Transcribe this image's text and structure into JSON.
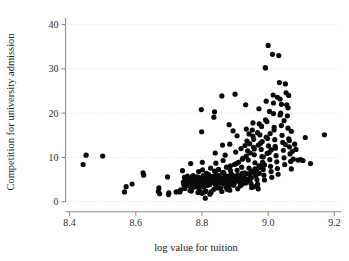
{
  "chart_data": {
    "type": "scatter",
    "title": "",
    "xlabel": "log value for tuition",
    "ylabel": "Competition for university admission",
    "xlim": [
      8.35,
      9.22
    ],
    "ylim": [
      -1.2,
      41.5
    ],
    "xticks": [
      8.4,
      8.6,
      8.8,
      9.0,
      9.2
    ],
    "xtick_labels": [
      "8.4",
      "8.6",
      "8.8",
      "9.0",
      "9.2"
    ],
    "yticks": [
      0,
      10,
      20,
      30,
      40
    ],
    "ytick_labels": [
      "0",
      "10",
      "20",
      "30",
      "40"
    ],
    "grid": "horizontal-dotted",
    "legend": "none",
    "marker": {
      "shape": "circle",
      "color": "#0a0a0a",
      "size_px": 2.6
    },
    "n_points": 312,
    "points": [
      [
        8.441,
        8.4
      ],
      [
        8.45,
        10.5
      ],
      [
        8.5,
        10.3
      ],
      [
        8.566,
        2.2
      ],
      [
        8.571,
        3.4
      ],
      [
        8.589,
        4.0
      ],
      [
        8.622,
        6.5
      ],
      [
        8.624,
        6.0
      ],
      [
        8.668,
        2.3
      ],
      [
        8.67,
        3.1
      ],
      [
        8.672,
        1.8
      ],
      [
        8.696,
        5.6
      ],
      [
        8.699,
        1.6
      ],
      [
        8.7,
        2.0
      ],
      [
        8.722,
        2.2
      ],
      [
        8.729,
        2.3
      ],
      [
        8.733,
        2.2
      ],
      [
        8.741,
        7.0
      ],
      [
        8.744,
        4.4
      ],
      [
        8.747,
        5.5
      ],
      [
        8.749,
        5.0
      ],
      [
        8.752,
        5.4
      ],
      [
        8.755,
        3.6
      ],
      [
        8.758,
        5.3
      ],
      [
        8.76,
        5.1
      ],
      [
        8.763,
        4.9
      ],
      [
        8.766,
        8.6
      ],
      [
        8.768,
        2.4
      ],
      [
        8.77,
        5.6
      ],
      [
        8.772,
        4.7
      ],
      [
        8.775,
        5.2
      ],
      [
        8.777,
        5.5
      ],
      [
        8.779,
        4.3
      ],
      [
        8.781,
        3.4
      ],
      [
        8.784,
        5.6
      ],
      [
        8.786,
        5.1
      ],
      [
        8.788,
        4.6
      ],
      [
        8.79,
        5.5
      ],
      [
        8.792,
        2.6
      ],
      [
        8.794,
        4.1
      ],
      [
        8.796,
        5.3
      ],
      [
        8.798,
        20.8
      ],
      [
        8.799,
        15.8
      ],
      [
        8.801,
        8.9
      ],
      [
        8.803,
        5.4
      ],
      [
        8.805,
        4.4
      ],
      [
        8.806,
        3.3
      ],
      [
        8.808,
        2.2
      ],
      [
        8.81,
        0.8
      ],
      [
        8.812,
        5.8
      ],
      [
        8.814,
        4.0
      ],
      [
        8.816,
        5.2
      ],
      [
        8.818,
        4.7
      ],
      [
        8.82,
        6.1
      ],
      [
        8.822,
        5.0
      ],
      [
        8.824,
        3.9
      ],
      [
        8.826,
        5.5
      ],
      [
        8.828,
        2.2
      ],
      [
        8.83,
        4.5
      ],
      [
        8.832,
        5.7
      ],
      [
        8.834,
        5.0
      ],
      [
        8.836,
        19.1
      ],
      [
        8.838,
        20.3
      ],
      [
        8.84,
        11.0
      ],
      [
        8.842,
        8.7
      ],
      [
        8.844,
        6.1
      ],
      [
        8.846,
        5.3
      ],
      [
        8.848,
        4.8
      ],
      [
        8.85,
        5.9
      ],
      [
        8.852,
        4.2
      ],
      [
        8.854,
        5.5
      ],
      [
        8.856,
        3.1
      ],
      [
        8.858,
        5.1
      ],
      [
        8.86,
        23.9
      ],
      [
        8.862,
        12.8
      ],
      [
        8.864,
        9.3
      ],
      [
        8.866,
        6.6
      ],
      [
        8.868,
        5.4
      ],
      [
        8.87,
        4.9
      ],
      [
        8.872,
        5.8
      ],
      [
        8.874,
        5.3
      ],
      [
        8.876,
        2.8
      ],
      [
        8.878,
        4.4
      ],
      [
        8.88,
        5.6
      ],
      [
        8.882,
        3.5
      ],
      [
        8.884,
        13.0
      ],
      [
        8.886,
        8.1
      ],
      [
        8.888,
        6.3
      ],
      [
        8.89,
        5.2
      ],
      [
        8.892,
        4.6
      ],
      [
        8.894,
        5.9
      ],
      [
        8.896,
        5.1
      ],
      [
        8.898,
        4.2
      ],
      [
        8.9,
        24.3
      ],
      [
        8.902,
        11.2
      ],
      [
        8.904,
        8.6
      ],
      [
        8.906,
        7.1
      ],
      [
        8.908,
        6.0
      ],
      [
        8.91,
        5.4
      ],
      [
        8.912,
        4.8
      ],
      [
        8.914,
        5.6
      ],
      [
        8.916,
        3.6
      ],
      [
        8.918,
        5.0
      ],
      [
        8.92,
        7.8
      ],
      [
        8.922,
        6.4
      ],
      [
        8.924,
        9.8
      ],
      [
        8.926,
        5.7
      ],
      [
        8.928,
        4.5
      ],
      [
        8.93,
        5.2
      ],
      [
        8.932,
        21.9
      ],
      [
        8.934,
        16.4
      ],
      [
        8.936,
        13.7
      ],
      [
        8.938,
        11.5
      ],
      [
        8.94,
        9.4
      ],
      [
        8.942,
        7.6
      ],
      [
        8.944,
        6.2
      ],
      [
        8.946,
        5.3
      ],
      [
        8.948,
        4.1
      ],
      [
        8.95,
        3.2
      ],
      [
        8.952,
        16.2
      ],
      [
        8.954,
        14.8
      ],
      [
        8.956,
        12.3
      ],
      [
        8.958,
        10.6
      ],
      [
        8.96,
        8.8
      ],
      [
        8.962,
        7.2
      ],
      [
        8.964,
        6.1
      ],
      [
        8.966,
        5.0
      ],
      [
        8.968,
        3.8
      ],
      [
        8.97,
        2.9
      ],
      [
        8.972,
        21.0
      ],
      [
        8.973,
        17.6
      ],
      [
        8.975,
        15.1
      ],
      [
        8.977,
        13.2
      ],
      [
        8.979,
        11.8
      ],
      [
        8.981,
        10.2
      ],
      [
        8.983,
        8.9
      ],
      [
        8.985,
        7.3
      ],
      [
        8.987,
        6.0
      ],
      [
        8.989,
        4.9
      ],
      [
        8.991,
        30.3
      ],
      [
        8.992,
        30.2
      ],
      [
        8.994,
        22.7
      ],
      [
        8.996,
        18.1
      ],
      [
        8.998,
        14.3
      ],
      [
        9.0,
        35.3
      ],
      [
        9.001,
        12.6
      ],
      [
        9.003,
        11.1
      ],
      [
        9.005,
        9.5
      ],
      [
        9.007,
        8.0
      ],
      [
        9.009,
        6.8
      ],
      [
        9.011,
        5.5
      ],
      [
        9.013,
        33.3
      ],
      [
        9.015,
        24.1
      ],
      [
        9.016,
        19.9
      ],
      [
        9.018,
        16.8
      ],
      [
        9.02,
        14.0
      ],
      [
        9.022,
        12.1
      ],
      [
        9.024,
        10.4
      ],
      [
        9.026,
        9.0
      ],
      [
        9.028,
        7.5
      ],
      [
        9.03,
        6.2
      ],
      [
        9.032,
        33.0
      ],
      [
        9.034,
        26.9
      ],
      [
        9.036,
        23.2
      ],
      [
        9.038,
        20.0
      ],
      [
        9.04,
        17.2
      ],
      [
        9.042,
        15.0
      ],
      [
        9.044,
        13.4
      ],
      [
        9.046,
        11.6
      ],
      [
        9.048,
        9.9
      ],
      [
        9.05,
        8.4
      ],
      [
        9.052,
        26.6
      ],
      [
        9.054,
        24.6
      ],
      [
        9.056,
        21.9
      ],
      [
        9.058,
        19.4
      ],
      [
        9.06,
        16.6
      ],
      [
        9.062,
        14.2
      ],
      [
        9.064,
        12.4
      ],
      [
        9.066,
        10.8
      ],
      [
        9.068,
        9.1
      ],
      [
        9.07,
        7.4
      ],
      [
        9.073,
        11.4
      ],
      [
        9.076,
        9.6
      ],
      [
        9.08,
        13.0
      ],
      [
        9.084,
        11.8
      ],
      [
        9.09,
        9.4
      ],
      [
        9.098,
        9.5
      ],
      [
        9.105,
        9.3
      ],
      [
        9.112,
        14.5
      ],
      [
        9.128,
        8.6
      ],
      [
        9.17,
        15.1
      ],
      [
        8.76,
        4.2
      ],
      [
        8.773,
        5.9
      ],
      [
        8.785,
        4.8
      ],
      [
        8.797,
        5.0
      ],
      [
        8.809,
        4.3
      ],
      [
        8.821,
        5.6
      ],
      [
        8.833,
        4.5
      ],
      [
        8.845,
        5.2
      ],
      [
        8.857,
        4.7
      ],
      [
        8.869,
        5.8
      ],
      [
        8.881,
        4.4
      ],
      [
        8.893,
        5.3
      ],
      [
        8.905,
        4.9
      ],
      [
        8.917,
        5.7
      ],
      [
        8.929,
        6.5
      ],
      [
        8.941,
        5.1
      ],
      [
        8.953,
        6.7
      ],
      [
        8.965,
        7.0
      ],
      [
        8.977,
        7.7
      ],
      [
        8.989,
        8.3
      ],
      [
        8.756,
        5.8
      ],
      [
        8.768,
        4.1
      ],
      [
        8.78,
        5.4
      ],
      [
        8.792,
        4.6
      ],
      [
        8.804,
        5.9
      ],
      [
        8.816,
        4.2
      ],
      [
        8.828,
        5.5
      ],
      [
        8.84,
        4.8
      ],
      [
        8.852,
        5.1
      ],
      [
        8.864,
        4.4
      ],
      [
        8.876,
        5.7
      ],
      [
        8.888,
        4.9
      ],
      [
        8.9,
        5.2
      ],
      [
        8.912,
        6.0
      ],
      [
        8.924,
        5.4
      ],
      [
        8.936,
        6.3
      ],
      [
        8.948,
        6.9
      ],
      [
        8.96,
        7.4
      ],
      [
        8.972,
        8.1
      ],
      [
        8.984,
        8.7
      ],
      [
        8.745,
        3.8
      ],
      [
        8.757,
        4.5
      ],
      [
        8.769,
        3.2
      ],
      [
        8.781,
        4.0
      ],
      [
        8.793,
        3.5
      ],
      [
        8.805,
        4.2
      ],
      [
        8.817,
        3.7
      ],
      [
        8.829,
        4.4
      ],
      [
        8.841,
        3.9
      ],
      [
        8.853,
        4.6
      ],
      [
        8.865,
        4.1
      ],
      [
        8.877,
        4.8
      ],
      [
        8.889,
        4.3
      ],
      [
        8.901,
        5.0
      ],
      [
        8.913,
        4.5
      ],
      [
        8.925,
        5.2
      ],
      [
        8.937,
        4.7
      ],
      [
        8.949,
        5.4
      ],
      [
        8.961,
        5.9
      ],
      [
        8.973,
        6.4
      ],
      [
        8.985,
        10.1
      ],
      [
        8.997,
        10.9
      ],
      [
        9.009,
        11.7
      ],
      [
        9.021,
        12.5
      ],
      [
        8.79,
        6.8
      ],
      [
        8.802,
        7.2
      ],
      [
        8.814,
        6.4
      ],
      [
        8.826,
        7.6
      ],
      [
        8.838,
        6.9
      ],
      [
        8.85,
        7.3
      ],
      [
        8.862,
        6.6
      ],
      [
        8.874,
        7.8
      ],
      [
        8.886,
        7.1
      ],
      [
        8.898,
        8.4
      ],
      [
        8.91,
        8.9
      ],
      [
        8.922,
        9.6
      ],
      [
        8.934,
        10.3
      ],
      [
        8.946,
        11.0
      ],
      [
        8.958,
        11.9
      ],
      [
        8.97,
        12.8
      ],
      [
        8.982,
        13.6
      ],
      [
        8.994,
        14.6
      ],
      [
        9.006,
        15.4
      ],
      [
        9.018,
        16.2
      ],
      [
        8.944,
        13.1
      ],
      [
        8.956,
        14.1
      ],
      [
        8.968,
        15.6
      ],
      [
        8.98,
        17.0
      ],
      [
        8.992,
        18.5
      ],
      [
        9.004,
        20.4
      ],
      [
        9.016,
        22.3
      ],
      [
        9.028,
        23.6
      ],
      [
        8.918,
        12.0
      ],
      [
        8.93,
        12.7
      ],
      [
        8.942,
        15.3
      ],
      [
        8.954,
        17.8
      ],
      [
        9.036,
        19.6
      ],
      [
        9.048,
        18.3
      ],
      [
        9.06,
        21.2
      ],
      [
        9.062,
        24.0
      ],
      [
        8.906,
        14.9
      ],
      [
        8.894,
        16.0
      ],
      [
        8.882,
        17.4
      ],
      [
        8.87,
        10.5
      ],
      [
        9.04,
        22.0
      ],
      [
        9.052,
        12.9
      ],
      [
        9.064,
        13.8
      ],
      [
        9.07,
        15.9
      ],
      [
        8.736,
        2.7
      ],
      [
        8.748,
        3.0
      ],
      [
        8.764,
        2.5
      ],
      [
        8.776,
        3.3
      ],
      [
        8.788,
        2.1
      ],
      [
        8.8,
        1.9
      ],
      [
        8.812,
        2.4
      ],
      [
        8.824,
        1.7
      ],
      [
        8.836,
        2.8
      ],
      [
        8.848,
        3.1
      ],
      [
        8.86,
        2.3
      ],
      [
        8.872,
        3.4
      ],
      [
        8.884,
        2.6
      ],
      [
        8.896,
        3.7
      ],
      [
        8.908,
        2.9
      ],
      [
        8.92,
        3.9
      ],
      [
        8.932,
        4.2
      ],
      [
        8.944,
        4.6
      ],
      [
        8.956,
        3.4
      ],
      [
        8.968,
        4.0
      ]
    ]
  }
}
